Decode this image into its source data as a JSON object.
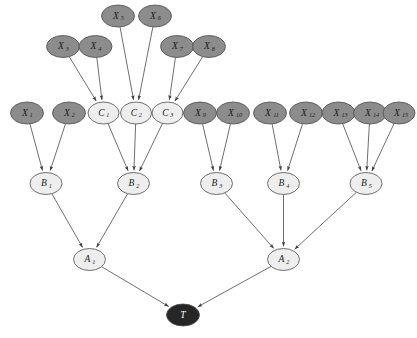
{
  "figure": {
    "type": "directed-acyclic-graph",
    "title": "",
    "background_color": "#ffffff"
  },
  "styles": {
    "observed_fill": "#8c8c8c",
    "latent_fill": "#eeeeee",
    "target_fill": "#262626",
    "node_stroke": "#4d4d4d",
    "edge_color": "#3f3f3f",
    "observed_text_color": "#1a1a1a",
    "latent_text_color": "#1a1a1a",
    "target_text_color": "#ffffff"
  },
  "legend": {
    "observed_label": "observed variable",
    "latent_label": "latent variable",
    "target_label": "target variable"
  },
  "nodes": [
    {
      "id": "X5",
      "base": "X",
      "sub": "5",
      "cx": 118.0,
      "cy": 16.0,
      "rx": 16.5,
      "ry": 11.0,
      "kind": "observed"
    },
    {
      "id": "X6",
      "base": "X",
      "sub": "6",
      "cx": 155.0,
      "cy": 16.0,
      "rx": 16.5,
      "ry": 11.0,
      "kind": "observed"
    },
    {
      "id": "X3",
      "base": "X",
      "sub": "3",
      "cx": 63.0,
      "cy": 46.5,
      "rx": 16.5,
      "ry": 11.0,
      "kind": "observed"
    },
    {
      "id": "X4",
      "base": "X",
      "sub": "4",
      "cx": 95.5,
      "cy": 46.5,
      "rx": 16.5,
      "ry": 11.0,
      "kind": "observed"
    },
    {
      "id": "X7",
      "base": "X",
      "sub": "7",
      "cx": 177.0,
      "cy": 46.5,
      "rx": 16.5,
      "ry": 11.0,
      "kind": "observed"
    },
    {
      "id": "X8",
      "base": "X",
      "sub": "8",
      "cx": 209.0,
      "cy": 46.5,
      "rx": 16.5,
      "ry": 11.0,
      "kind": "observed"
    },
    {
      "id": "X1",
      "base": "X",
      "sub": "1",
      "cx": 27.0,
      "cy": 113.0,
      "rx": 16.5,
      "ry": 11.0,
      "kind": "observed"
    },
    {
      "id": "X2",
      "base": "X",
      "sub": "2",
      "cx": 69.0,
      "cy": 113.0,
      "rx": 16.5,
      "ry": 11.0,
      "kind": "observed"
    },
    {
      "id": "C1",
      "base": "C",
      "sub": "1",
      "cx": 103.5,
      "cy": 113.0,
      "rx": 15.5,
      "ry": 11.0,
      "kind": "latent"
    },
    {
      "id": "C2",
      "base": "C",
      "sub": "2",
      "cx": 136.0,
      "cy": 113.0,
      "rx": 15.5,
      "ry": 11.0,
      "kind": "latent"
    },
    {
      "id": "C3",
      "base": "C",
      "sub": "3",
      "cx": 167.5,
      "cy": 113.0,
      "rx": 15.5,
      "ry": 11.0,
      "kind": "latent"
    },
    {
      "id": "X9",
      "base": "X",
      "sub": "9",
      "cx": 200.0,
      "cy": 113.0,
      "rx": 16.5,
      "ry": 11.0,
      "kind": "observed"
    },
    {
      "id": "X10",
      "base": "X",
      "sub": "10",
      "cx": 233.0,
      "cy": 113.0,
      "rx": 16.5,
      "ry": 11.0,
      "kind": "observed"
    },
    {
      "id": "X11",
      "base": "X",
      "sub": "11",
      "cx": 270.0,
      "cy": 113.0,
      "rx": 16.5,
      "ry": 11.0,
      "kind": "observed"
    },
    {
      "id": "X12",
      "base": "X",
      "sub": "12",
      "cx": 306.0,
      "cy": 113.0,
      "rx": 16.5,
      "ry": 11.0,
      "kind": "observed"
    },
    {
      "id": "X13",
      "base": "X",
      "sub": "13",
      "cx": 338.5,
      "cy": 113.0,
      "rx": 16.5,
      "ry": 11.0,
      "kind": "observed"
    },
    {
      "id": "X14",
      "base": "X",
      "sub": "14",
      "cx": 370.0,
      "cy": 113.0,
      "rx": 16.5,
      "ry": 11.0,
      "kind": "observed"
    },
    {
      "id": "X15",
      "base": "X",
      "sub": "15",
      "cx": 399.0,
      "cy": 113.0,
      "rx": 16.0,
      "ry": 11.0,
      "kind": "observed"
    },
    {
      "id": "B1",
      "base": "B",
      "sub": "1",
      "cx": 46.0,
      "cy": 183.5,
      "rx": 16.0,
      "ry": 11.0,
      "kind": "latent"
    },
    {
      "id": "B2",
      "base": "B",
      "sub": "2",
      "cx": 133.5,
      "cy": 183.5,
      "rx": 16.0,
      "ry": 11.0,
      "kind": "latent"
    },
    {
      "id": "B3",
      "base": "B",
      "sub": "3",
      "cx": 216.5,
      "cy": 183.5,
      "rx": 16.0,
      "ry": 11.0,
      "kind": "latent"
    },
    {
      "id": "B4",
      "base": "B",
      "sub": "4",
      "cx": 283.5,
      "cy": 183.5,
      "rx": 16.0,
      "ry": 11.0,
      "kind": "latent"
    },
    {
      "id": "B5",
      "base": "B",
      "sub": "5",
      "cx": 366.0,
      "cy": 183.5,
      "rx": 16.0,
      "ry": 11.0,
      "kind": "latent"
    },
    {
      "id": "A1",
      "base": "A",
      "sub": "1",
      "cx": 89.5,
      "cy": 259.5,
      "rx": 16.0,
      "ry": 11.0,
      "kind": "latent"
    },
    {
      "id": "A2",
      "base": "A",
      "sub": "2",
      "cx": 283.5,
      "cy": 259.5,
      "rx": 16.0,
      "ry": 11.0,
      "kind": "latent"
    },
    {
      "id": "T",
      "base": "T",
      "sub": "",
      "cx": 183.0,
      "cy": 315.0,
      "rx": 16.5,
      "ry": 11.0,
      "kind": "target"
    }
  ],
  "edges": [
    {
      "from": "X3",
      "to": "C1"
    },
    {
      "from": "X4",
      "to": "C1"
    },
    {
      "from": "X5",
      "to": "C2"
    },
    {
      "from": "X6",
      "to": "C2"
    },
    {
      "from": "X7",
      "to": "C3"
    },
    {
      "from": "X8",
      "to": "C3"
    },
    {
      "from": "X1",
      "to": "B1"
    },
    {
      "from": "X2",
      "to": "B1"
    },
    {
      "from": "C1",
      "to": "B2"
    },
    {
      "from": "C2",
      "to": "B2"
    },
    {
      "from": "C3",
      "to": "B2"
    },
    {
      "from": "X9",
      "to": "B3"
    },
    {
      "from": "X10",
      "to": "B3"
    },
    {
      "from": "X11",
      "to": "B4"
    },
    {
      "from": "X12",
      "to": "B4"
    },
    {
      "from": "X13",
      "to": "B5"
    },
    {
      "from": "X14",
      "to": "B5"
    },
    {
      "from": "X15",
      "to": "B5"
    },
    {
      "from": "B1",
      "to": "A1"
    },
    {
      "from": "B2",
      "to": "A1"
    },
    {
      "from": "B3",
      "to": "A2"
    },
    {
      "from": "B4",
      "to": "A2"
    },
    {
      "from": "B5",
      "to": "A2"
    },
    {
      "from": "A1",
      "to": "T"
    },
    {
      "from": "A2",
      "to": "T"
    }
  ]
}
